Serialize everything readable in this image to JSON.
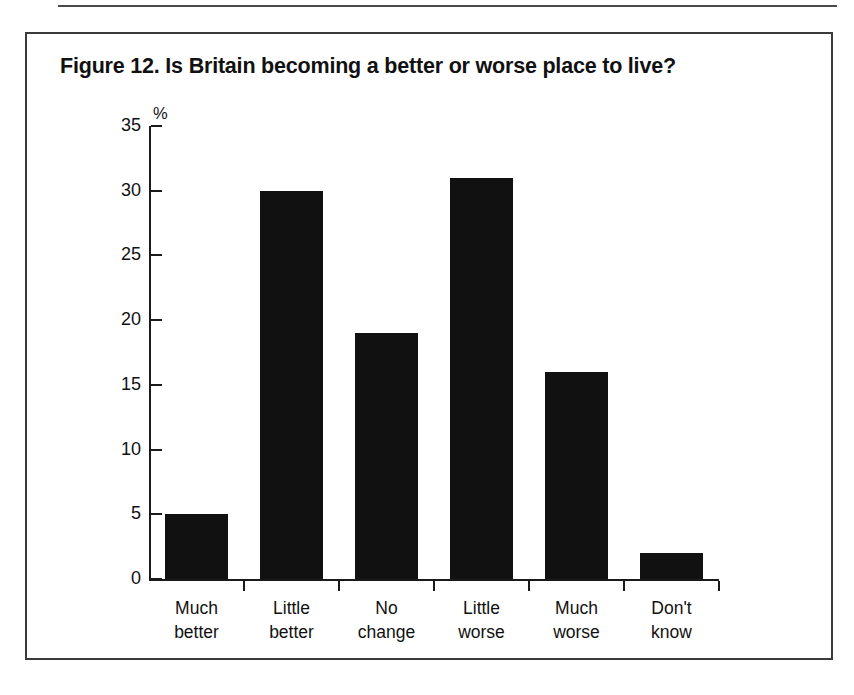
{
  "figure": {
    "title": "Figure 12. Is Britain becoming a better or worse place to live?",
    "frame_color": "#3a3a3a",
    "bar_color": "#111111",
    "axis_color": "#1a1a1a"
  },
  "chart_data": {
    "type": "bar",
    "title": "Figure 12. Is Britain becoming a better or worse place to live?",
    "categories": [
      "Much better",
      "Little better",
      "No change",
      "Little worse",
      "Much worse",
      "Don't know"
    ],
    "category_lines": [
      [
        "Much",
        "better"
      ],
      [
        "Little",
        "better"
      ],
      [
        "No",
        "change"
      ],
      [
        "Little",
        "worse"
      ],
      [
        "Much",
        "worse"
      ],
      [
        "Don't",
        "know"
      ]
    ],
    "values": [
      5,
      30,
      19,
      31,
      16,
      2
    ],
    "xlabel": "",
    "ylabel": "%",
    "ylim": [
      0,
      35
    ],
    "yticks": [
      0,
      5,
      10,
      15,
      20,
      25,
      30,
      35
    ],
    "ytick_labels": [
      "0",
      "5",
      "10",
      "15",
      "20",
      "25",
      "30",
      "35"
    ],
    "grid": false,
    "legend": false
  }
}
